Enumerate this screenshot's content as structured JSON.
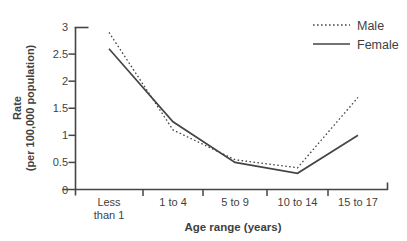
{
  "figure": {
    "background": "#ffffff"
  },
  "chart_data": {
    "type": "line",
    "title": "",
    "xlabel": "Age range (years)",
    "ylabel": "Rate (per 100,000 population)",
    "ylabel_lines": [
      "Rate",
      "(per 100,000 population)"
    ],
    "ylim": [
      0,
      3
    ],
    "yticks": [
      {
        "value": 0,
        "label": "0"
      },
      {
        "value": 0.5,
        "label": "0.5"
      },
      {
        "value": 1,
        "label": "1"
      },
      {
        "value": 1.5,
        "label": "1.5"
      },
      {
        "value": 2,
        "label": "2"
      },
      {
        "value": 2.5,
        "label": "2.5"
      },
      {
        "value": 3,
        "label": "3"
      }
    ],
    "categories": [
      {
        "label": "Less than 1",
        "lines": [
          "Less",
          "than 1"
        ]
      },
      {
        "label": "1 to 4",
        "lines": [
          "1 to 4"
        ]
      },
      {
        "label": "5 to 9",
        "lines": [
          "5 to 9"
        ]
      },
      {
        "label": "10 to 14",
        "lines": [
          "10 to 14"
        ]
      },
      {
        "label": "15 to 17",
        "lines": [
          "15 to 17"
        ]
      }
    ],
    "series": [
      {
        "name": "Male",
        "line_style": "dotted",
        "values": [
          2.9,
          1.1,
          0.55,
          0.4,
          1.7
        ]
      },
      {
        "name": "Female",
        "line_style": "solid",
        "values": [
          2.6,
          1.25,
          0.5,
          0.3,
          1.0
        ]
      }
    ],
    "legend_position": "top-right",
    "grid": false,
    "line_color": "#454545",
    "text_color": "#3f3f3f"
  }
}
